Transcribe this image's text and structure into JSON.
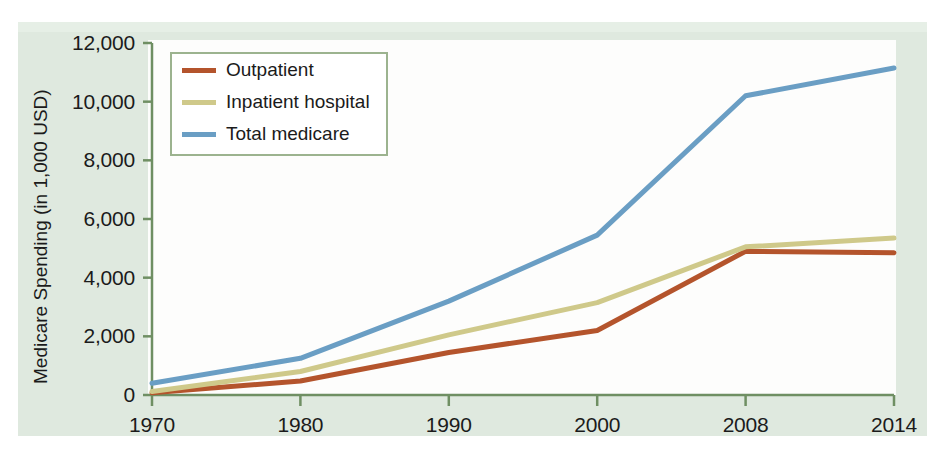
{
  "chart_data": {
    "type": "line",
    "title": "",
    "xlabel": "",
    "ylabel": "Medicare Spending (in 1,000 USD)",
    "categories": [
      "1970",
      "1980",
      "1990",
      "2000",
      "2008",
      "2014"
    ],
    "ylim": [
      0,
      12000
    ],
    "ytick_labels": [
      "0",
      "2,000",
      "4,000",
      "6,000",
      "8,000",
      "10,000",
      "12,000"
    ],
    "ytick_values": [
      0,
      2000,
      4000,
      6000,
      8000,
      10000,
      12000
    ],
    "grid": false,
    "legend_position": "top-left",
    "series": [
      {
        "name": "Outpatient",
        "color": "#b4542c",
        "values": [
          75,
          480,
          1450,
          2200,
          4900,
          4850
        ]
      },
      {
        "name": "Inpatient hospital",
        "color": "#cfc98a",
        "values": [
          120,
          800,
          2050,
          3150,
          5050,
          5350
        ]
      },
      {
        "name": "Total medicare",
        "color": "#6a9ec4",
        "values": [
          400,
          1250,
          3200,
          5450,
          10200,
          11150
        ]
      }
    ]
  },
  "axis": {
    "axis_color": "#6f8f63",
    "tick_color": "#6f8f63"
  },
  "legend": {
    "entries": [
      {
        "label": "Outpatient",
        "color": "#b4542c"
      },
      {
        "label": "Inpatient hospital",
        "color": "#cfc98a"
      },
      {
        "label": "Total medicare",
        "color": "#6a9ec4"
      }
    ]
  }
}
